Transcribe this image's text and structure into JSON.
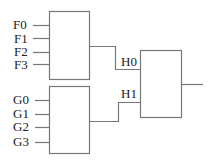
{
  "inputs_f": [
    "F0",
    "F1",
    "F2",
    "F3"
  ],
  "inputs_g": [
    "G0",
    "G1",
    "G2",
    "G3"
  ],
  "intermediate": [
    "H0",
    "H1"
  ],
  "colors": {
    "line": "#777777",
    "text": "#222222"
  }
}
